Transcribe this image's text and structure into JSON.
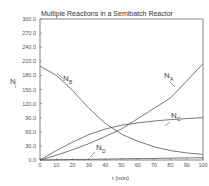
{
  "chart_data": {
    "type": "line",
    "title": "Multiple Reactions in a Semibatch Reactor",
    "xlabel": "t (min)",
    "ylabel": "N_i",
    "xlim": [
      0,
      100
    ],
    "ylim": [
      0,
      300
    ],
    "xticks": [
      "0",
      "10",
      "20",
      "30",
      "40",
      "50",
      "60",
      "70",
      "80",
      "90",
      "100"
    ],
    "yticks": [
      "0.0",
      "30.0",
      "60.0",
      "90.0",
      "120.0",
      "150.0",
      "180.0",
      "210.0",
      "240.0",
      "270.0",
      "300.0"
    ],
    "grid": false,
    "x": [
      0,
      10,
      20,
      30,
      40,
      50,
      60,
      70,
      80,
      90,
      100
    ],
    "series": [
      {
        "name": "N_A",
        "label_main": "N",
        "label_sub": "A",
        "values": [
          0,
          10,
          22,
          35,
          50,
          66,
          88,
          110,
          132,
          168,
          205
        ]
      },
      {
        "name": "N_B",
        "label_main": "N",
        "label_sub": "B",
        "values": [
          200,
          180,
          148,
          110,
          78,
          55,
          40,
          28,
          20,
          15,
          12
        ]
      },
      {
        "name": "N_C",
        "label_main": "N",
        "label_sub": "C",
        "values": [
          0,
          20,
          38,
          54,
          66,
          74,
          79,
          83,
          86,
          88,
          90
        ]
      },
      {
        "name": "N_D",
        "label_main": "N",
        "label_sub": "D",
        "values": [
          0,
          0.5,
          1,
          1.5,
          2,
          2.5,
          3,
          3.5,
          4,
          4.5,
          5
        ]
      }
    ]
  }
}
